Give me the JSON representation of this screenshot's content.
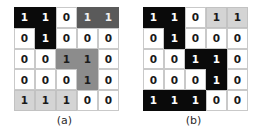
{
  "figure": {
    "width": 258,
    "height": 138,
    "background": "#ffffff"
  },
  "shades": {
    "white": "#ffffff",
    "light": "#d4d4d4",
    "mid": "#8c8c8c",
    "dark": "#5a5a5a",
    "black": "#0a0a0a"
  },
  "panels": [
    {
      "id": "a",
      "caption": "(a)",
      "rows": 5,
      "cols": 5,
      "values": [
        [
          "1",
          "1",
          "0",
          "1",
          "1"
        ],
        [
          "0",
          "1",
          "0",
          "0",
          "0"
        ],
        [
          "0",
          "0",
          "1",
          "1",
          "0"
        ],
        [
          "0",
          "0",
          "0",
          "1",
          "0"
        ],
        [
          "1",
          "1",
          "1",
          "0",
          "0"
        ]
      ],
      "shading": [
        [
          "black",
          "black",
          "white",
          "dark",
          "dark"
        ],
        [
          "white",
          "black",
          "white",
          "white",
          "white"
        ],
        [
          "white",
          "white",
          "mid",
          "mid",
          "white"
        ],
        [
          "white",
          "white",
          "white",
          "mid",
          "white"
        ],
        [
          "light",
          "light",
          "light",
          "white",
          "white"
        ]
      ]
    },
    {
      "id": "b",
      "caption": "(b)",
      "rows": 5,
      "cols": 5,
      "values": [
        [
          "1",
          "1",
          "0",
          "1",
          "1"
        ],
        [
          "0",
          "1",
          "0",
          "0",
          "0"
        ],
        [
          "0",
          "0",
          "1",
          "1",
          "0"
        ],
        [
          "0",
          "0",
          "0",
          "1",
          "0"
        ],
        [
          "1",
          "1",
          "1",
          "0",
          "0"
        ]
      ],
      "shading": [
        [
          "black",
          "black",
          "white",
          "light",
          "light"
        ],
        [
          "white",
          "black",
          "white",
          "white",
          "white"
        ],
        [
          "white",
          "white",
          "black",
          "black",
          "white"
        ],
        [
          "white",
          "white",
          "white",
          "black",
          "white"
        ],
        [
          "black",
          "black",
          "black",
          "white",
          "white"
        ]
      ]
    }
  ]
}
